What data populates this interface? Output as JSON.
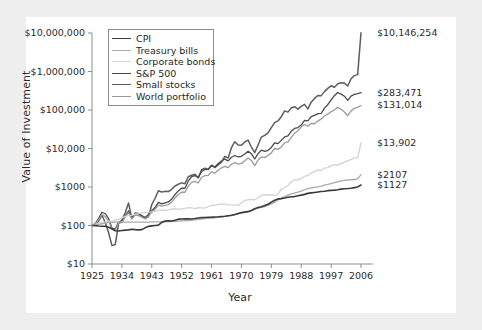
{
  "chart_data": {
    "type": "line",
    "title": "",
    "xlabel": "Year",
    "ylabel": "Value of Investment",
    "xlim": [
      1925,
      2006
    ],
    "ylim": [
      10,
      10000000
    ],
    "yscale": "log",
    "grid": false,
    "legend_position": "top-left-inside",
    "xticks": [
      "1925",
      "1934",
      "1943",
      "1952",
      "1961",
      "1970",
      "1979",
      "1988",
      "1997",
      "2006"
    ],
    "xtick_values": [
      1925,
      1934,
      1943,
      1952,
      1961,
      1970,
      1979,
      1988,
      1997,
      2006
    ],
    "yticks": [
      "$10",
      "$100",
      "$1000",
      "$10,000",
      "$100,000",
      "$1,000,000",
      "$10,000,000"
    ],
    "ytick_values": [
      10,
      100,
      1000,
      10000,
      100000,
      1000000,
      10000000
    ],
    "end_labels": [
      "$10,146,254",
      "$283,471",
      "$131,014",
      "$13,902",
      "$2107",
      "$1127"
    ],
    "series": [
      {
        "name": "Small stocks",
        "color": "#5d5d5d",
        "width": 1.5,
        "end_value": 10146254,
        "end_label": "$10,146,254",
        "x": [
          1925,
          1926,
          1927,
          1928,
          1929,
          1930,
          1931,
          1932,
          1933,
          1934,
          1935,
          1936,
          1937,
          1938,
          1939,
          1940,
          1941,
          1942,
          1943,
          1944,
          1945,
          1946,
          1947,
          1948,
          1949,
          1950,
          1951,
          1952,
          1953,
          1954,
          1955,
          1956,
          1957,
          1958,
          1959,
          1960,
          1961,
          1962,
          1963,
          1964,
          1965,
          1966,
          1967,
          1968,
          1969,
          1970,
          1971,
          1972,
          1973,
          1974,
          1975,
          1976,
          1977,
          1978,
          1979,
          1980,
          1981,
          1982,
          1983,
          1984,
          1985,
          1986,
          1987,
          1988,
          1989,
          1990,
          1991,
          1992,
          1993,
          1994,
          1995,
          1996,
          1997,
          1998,
          1999,
          2000,
          2001,
          2002,
          2003,
          2004,
          2005,
          2006
        ],
        "values": [
          100,
          107,
          130,
          184,
          120,
          65,
          30,
          32,
          111,
          140,
          215,
          385,
          150,
          210,
          205,
          170,
          150,
          168,
          350,
          510,
          800,
          740,
          770,
          760,
          870,
          1060,
          1180,
          1280,
          1220,
          1850,
          2020,
          2140,
          1720,
          2800,
          3080,
          2860,
          3680,
          3200,
          3760,
          4420,
          6200,
          5700,
          10500,
          15000,
          12300,
          12200,
          14800,
          16600,
          10800,
          7800,
          12300,
          19800,
          22000,
          25500,
          35000,
          47000,
          52000,
          67000,
          95000,
          88000,
          113000,
          122000,
          105000,
          124000,
          140000,
          107000,
          160000,
          200000,
          238000,
          236000,
          300000,
          365000,
          425000,
          390000,
          480000,
          510000,
          500000,
          420000,
          650000,
          780000,
          830000,
          10146254
        ]
      },
      {
        "name": "S&P 500",
        "color": "#4a4a4a",
        "width": 1.3,
        "end_value": 283471,
        "end_label": "$283,471",
        "x": [
          1925,
          1926,
          1927,
          1928,
          1929,
          1930,
          1931,
          1932,
          1933,
          1934,
          1935,
          1936,
          1937,
          1938,
          1939,
          1940,
          1941,
          1942,
          1943,
          1944,
          1945,
          1946,
          1947,
          1948,
          1949,
          1950,
          1951,
          1952,
          1953,
          1954,
          1955,
          1956,
          1957,
          1958,
          1959,
          1960,
          1961,
          1962,
          1963,
          1964,
          1965,
          1966,
          1967,
          1968,
          1969,
          1970,
          1971,
          1972,
          1973,
          1974,
          1975,
          1976,
          1977,
          1978,
          1979,
          1980,
          1981,
          1982,
          1983,
          1984,
          1985,
          1986,
          1987,
          1988,
          1989,
          1990,
          1991,
          1992,
          1993,
          1994,
          1995,
          1996,
          1997,
          1998,
          1999,
          2000,
          2001,
          2002,
          2003,
          2004,
          2005,
          2006
        ],
        "values": [
          100,
          112,
          154,
          221,
          202,
          152,
          86,
          80,
          123,
          121,
          179,
          240,
          155,
          203,
          202,
          182,
          161,
          194,
          244,
          292,
          398,
          366,
          387,
          408,
          485,
          638,
          791,
          937,
          928,
          1416,
          1862,
          1985,
          1772,
          2540,
          2844,
          2858,
          3624,
          3307,
          4062,
          4730,
          5318,
          4784,
          5930,
          6585,
          6027,
          6266,
          7161,
          8521,
          7271,
          5344,
          7333,
          9086,
          8433,
          8985,
          10646,
          14098,
          13404,
          16288,
          19963,
          21215,
          27947,
          33149,
          34890,
          40682,
          53577,
          51915,
          67722,
          72899,
          80218,
          81279,
          111800,
          137500,
          183400,
          235800,
          285300,
          259200,
          228400,
          178000,
          229000,
          254000,
          266000,
          283471
        ]
      },
      {
        "name": "World portfolio",
        "color": "#9a9a9a",
        "width": 1.3,
        "end_value": 131014,
        "end_label": "$131,014",
        "x": [
          1925,
          1926,
          1927,
          1928,
          1929,
          1930,
          1931,
          1932,
          1933,
          1934,
          1935,
          1936,
          1937,
          1938,
          1939,
          1940,
          1941,
          1942,
          1943,
          1944,
          1945,
          1946,
          1947,
          1948,
          1949,
          1950,
          1951,
          1952,
          1953,
          1954,
          1955,
          1956,
          1957,
          1958,
          1959,
          1960,
          1961,
          1962,
          1963,
          1964,
          1965,
          1966,
          1967,
          1968,
          1969,
          1970,
          1971,
          1972,
          1973,
          1974,
          1975,
          1976,
          1977,
          1978,
          1979,
          1980,
          1981,
          1982,
          1983,
          1984,
          1985,
          1986,
          1987,
          1988,
          1989,
          1990,
          1991,
          1992,
          1993,
          1994,
          1995,
          1996,
          1997,
          1998,
          1999,
          2000,
          2001,
          2002,
          2003,
          2004,
          2005,
          2006
        ],
        "values": [
          100,
          110,
          140,
          190,
          170,
          130,
          80,
          75,
          115,
          118,
          165,
          215,
          150,
          185,
          180,
          165,
          150,
          175,
          220,
          265,
          340,
          320,
          335,
          350,
          410,
          520,
          640,
          740,
          730,
          1050,
          1320,
          1400,
          1270,
          1790,
          1980,
          2000,
          2500,
          2280,
          2720,
          3150,
          3450,
          3180,
          3900,
          4280,
          3950,
          4100,
          4800,
          5700,
          4900,
          3600,
          5000,
          6000,
          5800,
          6600,
          7700,
          10000,
          9500,
          11000,
          14000,
          14800,
          19500,
          25000,
          29000,
          36000,
          42000,
          38000,
          45000,
          44000,
          52000,
          58000,
          70000,
          78000,
          90000,
          101000,
          118000,
          104000,
          89000,
          71000,
          95000,
          110000,
          118000,
          131014
        ]
      },
      {
        "name": "Corporate bonds",
        "color": "#d2d2d2",
        "width": 1.3,
        "end_value": 13902,
        "end_label": "$13,902",
        "x": [
          1925,
          1926,
          1927,
          1928,
          1929,
          1930,
          1931,
          1932,
          1933,
          1934,
          1935,
          1936,
          1937,
          1938,
          1939,
          1940,
          1941,
          1942,
          1943,
          1944,
          1945,
          1946,
          1947,
          1948,
          1949,
          1950,
          1951,
          1952,
          1953,
          1954,
          1955,
          1956,
          1957,
          1958,
          1959,
          1960,
          1961,
          1962,
          1963,
          1964,
          1965,
          1966,
          1967,
          1968,
          1969,
          1970,
          1971,
          1972,
          1973,
          1974,
          1975,
          1976,
          1977,
          1978,
          1979,
          1980,
          1981,
          1982,
          1983,
          1984,
          1985,
          1986,
          1987,
          1988,
          1989,
          1990,
          1991,
          1992,
          1993,
          1994,
          1995,
          1996,
          1997,
          1998,
          1999,
          2000,
          2001,
          2002,
          2003,
          2004,
          2005,
          2006
        ],
        "values": [
          100,
          107,
          116,
          120,
          124,
          132,
          122,
          140,
          143,
          157,
          172,
          184,
          186,
          196,
          202,
          212,
          215,
          219,
          226,
          234,
          248,
          250,
          249,
          256,
          268,
          270,
          262,
          270,
          278,
          290,
          288,
          275,
          290,
          288,
          283,
          311,
          327,
          337,
          347,
          362,
          361,
          344,
          338,
          342,
          330,
          389,
          440,
          470,
          478,
          466,
          525,
          610,
          630,
          630,
          620,
          600,
          650,
          880,
          970,
          1100,
          1350,
          1550,
          1540,
          1680,
          1880,
          1990,
          2290,
          2500,
          2790,
          2680,
          3130,
          3200,
          3550,
          3800,
          3700,
          4100,
          4450,
          4800,
          5200,
          5600,
          5800,
          13902
        ]
      },
      {
        "name": "Treasury bills",
        "color": "#a9a9a9",
        "width": 1.3,
        "end_value": 2107,
        "end_label": "$2107",
        "x": [
          1925,
          1926,
          1927,
          1928,
          1929,
          1930,
          1931,
          1932,
          1933,
          1934,
          1935,
          1936,
          1937,
          1938,
          1939,
          1940,
          1941,
          1942,
          1943,
          1944,
          1945,
          1946,
          1947,
          1948,
          1949,
          1950,
          1951,
          1952,
          1953,
          1954,
          1955,
          1956,
          1957,
          1958,
          1959,
          1960,
          1961,
          1962,
          1963,
          1964,
          1965,
          1966,
          1967,
          1968,
          1969,
          1970,
          1971,
          1972,
          1973,
          1974,
          1975,
          1976,
          1977,
          1978,
          1979,
          1980,
          1981,
          1982,
          1983,
          1984,
          1985,
          1986,
          1987,
          1988,
          1989,
          1990,
          1991,
          1992,
          1993,
          1994,
          1995,
          1996,
          1997,
          1998,
          1999,
          2000,
          2001,
          2002,
          2003,
          2004,
          2005,
          2006
        ],
        "values": [
          100,
          103,
          107,
          111,
          116,
          120,
          121,
          122,
          122,
          122,
          122,
          123,
          123,
          123,
          123,
          123,
          123,
          123,
          124,
          124,
          124,
          124,
          125,
          126,
          127,
          128,
          130,
          132,
          134,
          135,
          137,
          140,
          144,
          146,
          150,
          153,
          155,
          158,
          162,
          166,
          171,
          177,
          182,
          189,
          200,
          212,
          223,
          231,
          248,
          268,
          284,
          297,
          311,
          333,
          364,
          404,
          464,
          516,
          563,
          617,
          661,
          697,
          733,
          782,
          849,
          910,
          950,
          984,
          1013,
          1053,
          1114,
          1170,
          1231,
          1296,
          1362,
          1436,
          1495,
          1520,
          1535,
          1565,
          1625,
          2107
        ]
      },
      {
        "name": "CPI",
        "color": "#3a3a3a",
        "width": 1.6,
        "end_value": 1127,
        "end_label": "$1127",
        "x": [
          1925,
          1926,
          1927,
          1928,
          1929,
          1930,
          1931,
          1932,
          1933,
          1934,
          1935,
          1936,
          1937,
          1938,
          1939,
          1940,
          1941,
          1942,
          1943,
          1944,
          1945,
          1946,
          1947,
          1948,
          1949,
          1950,
          1951,
          1952,
          1953,
          1954,
          1955,
          1956,
          1957,
          1958,
          1959,
          1960,
          1961,
          1962,
          1963,
          1964,
          1965,
          1966,
          1967,
          1968,
          1969,
          1970,
          1971,
          1972,
          1973,
          1974,
          1975,
          1976,
          1977,
          1978,
          1979,
          1980,
          1981,
          1982,
          1983,
          1984,
          1985,
          1986,
          1987,
          1988,
          1989,
          1990,
          1991,
          1992,
          1993,
          1994,
          1995,
          1996,
          1997,
          1998,
          1999,
          2000,
          2001,
          2002,
          2003,
          2004,
          2005,
          2006
        ],
        "values": [
          100,
          99,
          97,
          96,
          96,
          90,
          82,
          73,
          72,
          74,
          76,
          77,
          80,
          78,
          77,
          78,
          87,
          95,
          98,
          100,
          102,
          120,
          130,
          133,
          131,
          137,
          146,
          148,
          149,
          149,
          148,
          152,
          157,
          160,
          162,
          164,
          165,
          167,
          169,
          172,
          174,
          180,
          185,
          194,
          205,
          216,
          223,
          229,
          246,
          273,
          293,
          308,
          329,
          357,
          404,
          451,
          491,
          500,
          518,
          540,
          559,
          564,
          590,
          615,
          644,
          683,
          703,
          722,
          743,
          761,
          779,
          803,
          816,
          828,
          851,
          880,
          897,
          911,
          931,
          963,
          1004,
          1127
        ]
      }
    ]
  },
  "legend": {
    "items": [
      {
        "label": "CPI",
        "color": "#3a3a3a",
        "width": "1.9px"
      },
      {
        "label": "Treasury bills",
        "color": "#a9a9a9",
        "width": "1.5px"
      },
      {
        "label": "Corporate bonds",
        "color": "#d9d9d9",
        "width": "1.5px"
      },
      {
        "label": "S&P 500",
        "color": "#4a4a4a",
        "width": "1.9px"
      },
      {
        "label": "Small stocks",
        "color": "#5d5d5d",
        "width": "1.7px"
      },
      {
        "label": "World portfolio",
        "color": "#9a9a9a",
        "width": "1.5px"
      }
    ]
  },
  "colors": {
    "page_background": "#eeeeee",
    "card_background": "#ffffff",
    "axis": "#8d8d8d",
    "text": "#2b2b2b"
  }
}
